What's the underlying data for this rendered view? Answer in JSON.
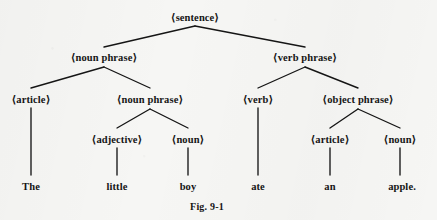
{
  "figure": {
    "caption": "Fig. 9-1",
    "caption_x": 207,
    "caption_y": 201,
    "background_color": "#f6f6f4",
    "ink_color": "#151515",
    "width": 437,
    "height": 220,
    "sentence": "The little boy ate an apple."
  },
  "nodes": [
    {
      "id": "sentence",
      "label": "⟨sentence⟩",
      "kind": "nonterminal",
      "level": 0,
      "x": 195,
      "y": 12
    },
    {
      "id": "noun_phrase_1",
      "label": "⟨noun phrase⟩",
      "kind": "nonterminal",
      "level": 1,
      "x": 104,
      "y": 52
    },
    {
      "id": "verb_phrase",
      "label": "⟨verb phrase⟩",
      "kind": "nonterminal",
      "level": 1,
      "x": 305,
      "y": 52
    },
    {
      "id": "article_1",
      "label": "⟨article⟩",
      "kind": "nonterminal",
      "level": 2,
      "x": 31,
      "y": 94
    },
    {
      "id": "noun_phrase_2",
      "label": "⟨noun phrase⟩",
      "kind": "nonterminal",
      "level": 2,
      "x": 150,
      "y": 94
    },
    {
      "id": "verb",
      "label": "⟨verb⟩",
      "kind": "nonterminal",
      "level": 2,
      "x": 258,
      "y": 94
    },
    {
      "id": "object_phrase",
      "label": "⟨object phrase⟩",
      "kind": "nonterminal",
      "level": 2,
      "x": 358,
      "y": 94
    },
    {
      "id": "adjective",
      "label": "⟨adjective⟩",
      "kind": "nonterminal",
      "level": 3,
      "x": 117,
      "y": 134
    },
    {
      "id": "noun_1",
      "label": "⟨noun⟩",
      "kind": "nonterminal",
      "level": 3,
      "x": 188,
      "y": 134
    },
    {
      "id": "article_2",
      "label": "⟨article⟩",
      "kind": "nonterminal",
      "level": 3,
      "x": 330,
      "y": 134
    },
    {
      "id": "noun_2",
      "label": "⟨noun⟩",
      "kind": "nonterminal",
      "level": 3,
      "x": 400,
      "y": 134
    },
    {
      "id": "word_the",
      "label": "The",
      "kind": "terminal",
      "level": 4,
      "x": 31,
      "y": 181
    },
    {
      "id": "word_little",
      "label": "little",
      "kind": "terminal",
      "level": 4,
      "x": 117,
      "y": 181
    },
    {
      "id": "word_boy",
      "label": "boy",
      "kind": "terminal",
      "level": 4,
      "x": 188,
      "y": 181
    },
    {
      "id": "word_ate",
      "label": "ate",
      "kind": "terminal",
      "level": 4,
      "x": 258,
      "y": 181
    },
    {
      "id": "word_an",
      "label": "an",
      "kind": "terminal",
      "level": 4,
      "x": 330,
      "y": 181
    },
    {
      "id": "word_apple",
      "label": "apple.",
      "kind": "terminal",
      "level": 4,
      "x": 402,
      "y": 181
    }
  ],
  "edges": [
    {
      "from": "sentence",
      "to": "noun_phrase_1",
      "x1": 195,
      "y1": 26,
      "x2": 104,
      "y2": 47
    },
    {
      "from": "sentence",
      "to": "verb_phrase",
      "x1": 195,
      "y1": 26,
      "x2": 305,
      "y2": 47
    },
    {
      "from": "noun_phrase_1",
      "to": "article_1",
      "x1": 104,
      "y1": 67,
      "x2": 31,
      "y2": 88
    },
    {
      "from": "noun_phrase_1",
      "to": "noun_phrase_2",
      "x1": 104,
      "y1": 67,
      "x2": 150,
      "y2": 88
    },
    {
      "from": "verb_phrase",
      "to": "verb",
      "x1": 305,
      "y1": 67,
      "x2": 258,
      "y2": 88
    },
    {
      "from": "verb_phrase",
      "to": "object_phrase",
      "x1": 305,
      "y1": 67,
      "x2": 358,
      "y2": 88
    },
    {
      "from": "article_1",
      "to": "word_the",
      "x1": 31,
      "y1": 108,
      "x2": 31,
      "y2": 175
    },
    {
      "from": "noun_phrase_2",
      "to": "adjective",
      "x1": 150,
      "y1": 109,
      "x2": 117,
      "y2": 128
    },
    {
      "from": "noun_phrase_2",
      "to": "noun_1",
      "x1": 150,
      "y1": 109,
      "x2": 188,
      "y2": 128
    },
    {
      "from": "verb",
      "to": "word_ate",
      "x1": 258,
      "y1": 108,
      "x2": 258,
      "y2": 175
    },
    {
      "from": "object_phrase",
      "to": "article_2",
      "x1": 358,
      "y1": 109,
      "x2": 330,
      "y2": 128
    },
    {
      "from": "object_phrase",
      "to": "noun_2",
      "x1": 358,
      "y1": 109,
      "x2": 400,
      "y2": 128
    },
    {
      "from": "adjective",
      "to": "word_little",
      "x1": 117,
      "y1": 148,
      "x2": 117,
      "y2": 175
    },
    {
      "from": "noun_1",
      "to": "word_boy",
      "x1": 188,
      "y1": 148,
      "x2": 188,
      "y2": 175
    },
    {
      "from": "article_2",
      "to": "word_an",
      "x1": 330,
      "y1": 148,
      "x2": 330,
      "y2": 175
    },
    {
      "from": "noun_2",
      "to": "word_apple",
      "x1": 400,
      "y1": 148,
      "x2": 400,
      "y2": 175
    }
  ]
}
